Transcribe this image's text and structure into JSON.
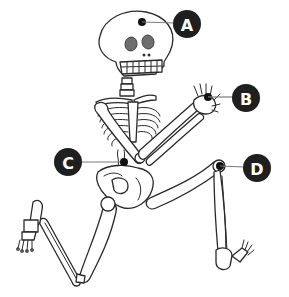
{
  "diagram": {
    "colors": {
      "badge": "#1f1f1f",
      "badge_text": "#ffffff",
      "leader_line": "#7a7a7a",
      "marker_dot": "#111111",
      "eye_socket": "#6e6e6e",
      "outline": "#2a2a2a",
      "background": "#ffffff"
    },
    "labels": [
      {
        "id": "A",
        "text": "A",
        "part": "skull"
      },
      {
        "id": "B",
        "text": "B",
        "part": "hand"
      },
      {
        "id": "C",
        "text": "C",
        "part": "pelvis"
      },
      {
        "id": "D",
        "text": "D",
        "part": "knee"
      }
    ]
  }
}
